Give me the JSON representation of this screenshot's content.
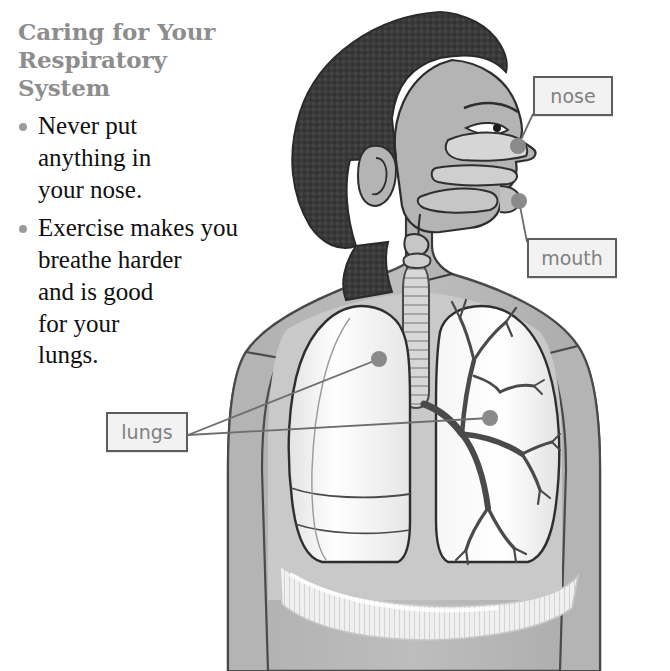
{
  "page": {
    "title": "Caring for Your\nRespiratory\nSystem",
    "background_color": "#ffffff",
    "title_color": "#8d8d8d",
    "body_text_color": "#101010"
  },
  "care_tips": [
    {
      "text": "Never put\nanything in\nyour nose.",
      "bullet": "bullet-dot"
    },
    {
      "text": "Exercise makes you\nbreathe harder\nand is good\nfor your\nlungs.",
      "bullet": "bullet-dot"
    }
  ],
  "callouts": [
    {
      "id": "nose",
      "label": "nose",
      "border_color": "#5d5d5d",
      "fill_color": "#f2f2f2",
      "text_color": "#808080"
    },
    {
      "id": "mouth",
      "label": "mouth",
      "border_color": "#5d5d5d",
      "fill_color": "#f2f2f2",
      "text_color": "#808080"
    },
    {
      "id": "lungs",
      "label": "lungs",
      "border_color": "#5d5d5d",
      "fill_color": "#f2f2f2",
      "text_color": "#808080"
    }
  ],
  "illustration": {
    "name": "respiratory-system-diagram",
    "description": "Side profile of a child showing the respiratory system: nasal cavity, mouth, trachea, two lungs with bronchial tree, and diaphragm",
    "parts": [
      "hair",
      "face",
      "ear",
      "nasal-cavity",
      "palate",
      "tongue",
      "lips",
      "neck",
      "trachea",
      "left-lung",
      "right-lung",
      "bronchial-tree",
      "diaphragm",
      "torso",
      "left-arm",
      "right-arm"
    ],
    "colors": {
      "hair": "#3a3a3a",
      "skin": "#b4b4b4",
      "body_fill": "#b9b9b9",
      "chest_cavity": "#c9c9c9",
      "lung_fill": "#f4f4f4",
      "diaphragm": "#ededed",
      "outline": "#2e2e2e",
      "leader_line": "#6d6d6d",
      "marker_dot": "#8a8a8a"
    },
    "marker_dots": [
      {
        "part": "nose",
        "x": 518,
        "y": 146
      },
      {
        "part": "mouth",
        "x": 519,
        "y": 201
      },
      {
        "part": "left-lung",
        "x": 379,
        "y": 359
      },
      {
        "part": "right-lung",
        "x": 490,
        "y": 418
      }
    ]
  }
}
